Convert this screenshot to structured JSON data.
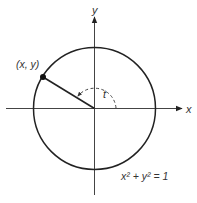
{
  "diagram": {
    "type": "unit-circle",
    "axes": {
      "x_label": "x",
      "y_label": "y"
    },
    "point_label": "(x, y)",
    "angle_label": "t",
    "equation": "x² + y² = 1",
    "colors": {
      "stroke": "#222222",
      "axis": "#444444",
      "text": "#333333"
    }
  }
}
